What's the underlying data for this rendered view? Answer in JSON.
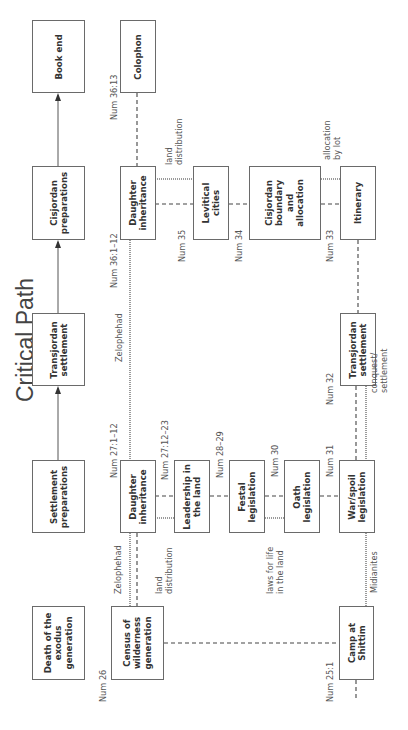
{
  "title": "Critical Path",
  "critical_path": [
    {
      "id": "book-end",
      "label": "Book end"
    },
    {
      "id": "cisjordan-preparations",
      "label": "Cisjordan\npreparations"
    },
    {
      "id": "transjordan-settlement",
      "label": "Transjordan\nsettlement"
    },
    {
      "id": "settlement-preparations",
      "label": "Settlement\npreparations"
    },
    {
      "id": "death-exodus-generation",
      "label": "Death of the\nexodus\ngeneration"
    }
  ],
  "nodes": {
    "colophon": {
      "label": "Colophon",
      "ref": "Num 36:13"
    },
    "daughter_inheritance_36": {
      "label": "Daughter\ninheritance",
      "ref": "Num 36:1–12"
    },
    "levitical_cities": {
      "label": "Levitical\ncities",
      "ref": "Num 35"
    },
    "cisjordan_boundary": {
      "label": "Cisjordan\nboundary\nand\nallocation",
      "ref": "Num 34"
    },
    "itinerary": {
      "label": "Itinerary",
      "ref": "Num 33"
    },
    "transjordan_settlement_32": {
      "label": "Transjordan\nsettlement",
      "ref": "Num 32"
    },
    "daughter_inheritance_27": {
      "label": "Daughter\ninheritance",
      "ref": "Num 27:1–12"
    },
    "leadership": {
      "label": "Leadership in\nthe land",
      "ref": "Num 27:12–23"
    },
    "festal": {
      "label": "Festal\nlegislation",
      "ref": "Num 28–29"
    },
    "oath": {
      "label": "Oath\nlegislation",
      "ref": "Num 30"
    },
    "war_spoil": {
      "label": "War/spoil\nlegislation",
      "ref": "Num 31"
    },
    "census": {
      "label": "Census of\nwilderness\ngeneration",
      "ref": "Num 26"
    },
    "camp_shittim": {
      "label": "Camp at\nShittim",
      "ref": "Num 25:1"
    }
  },
  "annotations": {
    "land_distribution_top": "land\ndistribution",
    "allocation_by_lot": "allocation\nby lot",
    "zelophehad_top": "Zelophehad",
    "conquest_settlement": "conquest/\nsettlement",
    "zelophehad_bottom": "Zelophehad",
    "land_distribution_bottom": "land\ndistribution",
    "laws_for_life": "laws for life\nin the land",
    "midianites": "Midianites"
  },
  "colors": {
    "box_border": "#6a6a6a",
    "solid_line": "#555555",
    "dashed_line": "#444444",
    "dotted_line": "#9a9a9a",
    "text": "#333333"
  }
}
